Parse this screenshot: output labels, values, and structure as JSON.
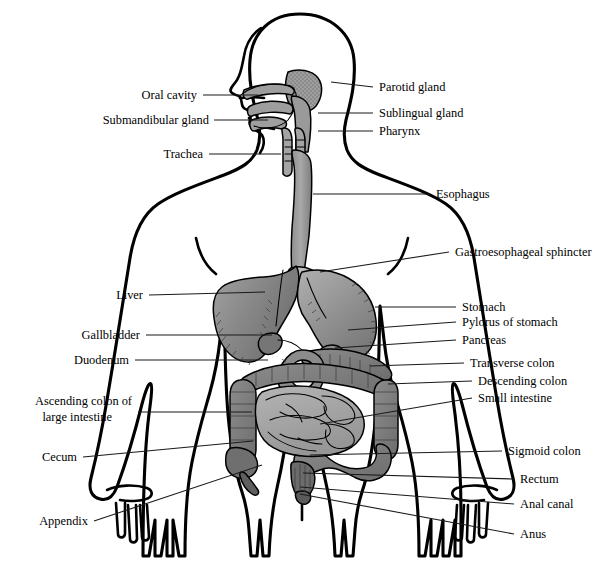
{
  "diagram": {
    "style": "black-and-white line drawing with grayscale shaded organs and straight leader lines",
    "background_color": "#ffffff",
    "line_color": "#000000",
    "colors": {
      "outline": "#000000",
      "leader_line": "#1a1a1a",
      "liver_fill": "#8a8a8a",
      "stomach_fill": "#949494",
      "esophagus_fill": "#9a9a9a",
      "large_intestine_fill": "#7d7d7d",
      "small_intestine_fill": "#a9a9a9",
      "pancreas_fill": "#8f8f8f",
      "gland_fill": "#9e9e9e",
      "body_fill": "#ffffff"
    }
  },
  "labels": {
    "left": [
      {
        "id": "oral-cavity",
        "text": "Oral cavity",
        "text_x": 197,
        "text_y": 99,
        "line_x1": 203,
        "line_y1": 95,
        "line_x2": 258,
        "line_y2": 95
      },
      {
        "id": "submandibular-gland",
        "text": "Submandibular gland",
        "text_x": 209,
        "text_y": 124,
        "line_x1": 214,
        "line_y1": 120,
        "line_x2": 268,
        "line_y2": 120
      },
      {
        "id": "trachea",
        "text": "Trachea",
        "text_x": 203,
        "text_y": 158,
        "line_x1": 209,
        "line_y1": 154,
        "line_x2": 281,
        "line_y2": 154
      },
      {
        "id": "liver",
        "text": "Liver",
        "text_x": 143,
        "text_y": 299,
        "line_x1": 149,
        "line_y1": 295,
        "line_x2": 265,
        "line_y2": 292
      },
      {
        "id": "gallbladder",
        "text": "Gallbladder",
        "text_x": 140,
        "text_y": 339,
        "line_x1": 146,
        "line_y1": 335,
        "line_x2": 272,
        "line_y2": 335
      },
      {
        "id": "duodenum",
        "text": "Duodenum",
        "text_x": 129,
        "text_y": 364,
        "line_x1": 135,
        "line_y1": 360,
        "line_x2": 268,
        "line_y2": 360
      },
      {
        "id": "ascending-colon",
        "text": "Ascending colon of",
        "text2": "large intestine",
        "text_x": 132,
        "text_y": 405,
        "text2_x": 112,
        "text2_y": 421,
        "line_x1": 138,
        "line_y1": 412,
        "line_x2": 252,
        "line_y2": 412
      },
      {
        "id": "cecum",
        "text": "Cecum",
        "text_x": 77,
        "text_y": 461,
        "line_x1": 83,
        "line_y1": 457,
        "line_x2": 253,
        "line_y2": 441
      },
      {
        "id": "appendix",
        "text": "Appendix",
        "text_x": 88,
        "text_y": 525,
        "line_x1": 94,
        "line_y1": 521,
        "line_x2": 262,
        "line_y2": 465
      }
    ],
    "right": [
      {
        "id": "parotid-gland",
        "text": "Parotid gland",
        "text_x": 379,
        "text_y": 91,
        "line_x1": 373,
        "line_y1": 87,
        "line_x2": 331,
        "line_y2": 82
      },
      {
        "id": "sublingual-gland",
        "text": "Sublingual gland",
        "text_x": 379,
        "text_y": 117,
        "line_x1": 373,
        "line_y1": 113,
        "line_x2": 318,
        "line_y2": 113
      },
      {
        "id": "pharynx",
        "text": "Pharynx",
        "text_x": 379,
        "text_y": 135,
        "line_x1": 373,
        "line_y1": 131,
        "line_x2": 318,
        "line_y2": 131
      },
      {
        "id": "esophagus",
        "text": "Esophagus",
        "text_x": 436,
        "text_y": 198,
        "line_x1": 430,
        "line_y1": 194,
        "line_x2": 313,
        "line_y2": 194
      },
      {
        "id": "gastroesophageal-sphincter",
        "text": "Gastroesophageal sphincter",
        "text_x": 455,
        "text_y": 256,
        "line_x1": 449,
        "line_y1": 252,
        "line_x2": 320,
        "line_y2": 272
      },
      {
        "id": "stomach",
        "text": "Stomach",
        "text_x": 462,
        "text_y": 311,
        "line_x1": 456,
        "line_y1": 307,
        "line_x2": 375,
        "line_y2": 307
      },
      {
        "id": "pylorus-of-stomach",
        "text": "Pylorus of stomach",
        "text_x": 462,
        "text_y": 326,
        "line_x1": 456,
        "line_y1": 322,
        "line_x2": 348,
        "line_y2": 330
      },
      {
        "id": "pancreas",
        "text": "Pancreas",
        "text_x": 462,
        "text_y": 344,
        "line_x1": 456,
        "line_y1": 340,
        "line_x2": 335,
        "line_y2": 348
      },
      {
        "id": "transverse-colon",
        "text": "Transverse colon",
        "text_x": 470,
        "text_y": 367,
        "line_x1": 464,
        "line_y1": 363,
        "line_x2": 370,
        "line_y2": 366
      },
      {
        "id": "descending-colon",
        "text": "Descending colon",
        "text_x": 478,
        "text_y": 385,
        "line_x1": 472,
        "line_y1": 381,
        "line_x2": 388,
        "line_y2": 384
      },
      {
        "id": "small-intestine",
        "text": "Small intestine",
        "text_x": 478,
        "text_y": 402,
        "line_x1": 472,
        "line_y1": 398,
        "line_x2": 320,
        "line_y2": 424
      },
      {
        "id": "sigmoid-colon",
        "text": "Sigmoid colon",
        "text_x": 508,
        "text_y": 455,
        "line_x1": 502,
        "line_y1": 451,
        "line_x2": 310,
        "line_y2": 455
      },
      {
        "id": "rectum",
        "text": "Rectum",
        "text_x": 520,
        "text_y": 483,
        "line_x1": 514,
        "line_y1": 479,
        "line_x2": 303,
        "line_y2": 473
      },
      {
        "id": "anal-canal",
        "text": "Anal canal",
        "text_x": 520,
        "text_y": 508,
        "line_x1": 514,
        "line_y1": 504,
        "line_x2": 300,
        "line_y2": 487
      },
      {
        "id": "anus",
        "text": "Anus",
        "text_x": 520,
        "text_y": 538,
        "line_x1": 514,
        "line_y1": 534,
        "line_x2": 300,
        "line_y2": 494
      }
    ]
  },
  "structures": [
    {
      "id": "oral-cavity",
      "name": "Oral cavity"
    },
    {
      "id": "submandibular-gland",
      "name": "Submandibular gland"
    },
    {
      "id": "trachea",
      "name": "Trachea"
    },
    {
      "id": "parotid-gland",
      "name": "Parotid gland"
    },
    {
      "id": "sublingual-gland",
      "name": "Sublingual gland"
    },
    {
      "id": "pharynx",
      "name": "Pharynx"
    },
    {
      "id": "esophagus",
      "name": "Esophagus"
    },
    {
      "id": "gastroesophageal-sphincter",
      "name": "Gastroesophageal sphincter"
    },
    {
      "id": "liver",
      "name": "Liver"
    },
    {
      "id": "stomach",
      "name": "Stomach"
    },
    {
      "id": "pylorus-of-stomach",
      "name": "Pylorus of stomach"
    },
    {
      "id": "gallbladder",
      "name": "Gallbladder"
    },
    {
      "id": "pancreas",
      "name": "Pancreas"
    },
    {
      "id": "duodenum",
      "name": "Duodenum"
    },
    {
      "id": "transverse-colon",
      "name": "Transverse colon"
    },
    {
      "id": "descending-colon",
      "name": "Descending colon"
    },
    {
      "id": "ascending-colon",
      "name": "Ascending colon of large intestine"
    },
    {
      "id": "small-intestine",
      "name": "Small intestine"
    },
    {
      "id": "cecum",
      "name": "Cecum"
    },
    {
      "id": "appendix",
      "name": "Appendix"
    },
    {
      "id": "sigmoid-colon",
      "name": "Sigmoid colon"
    },
    {
      "id": "rectum",
      "name": "Rectum"
    },
    {
      "id": "anal-canal",
      "name": "Anal canal"
    },
    {
      "id": "anus",
      "name": "Anus"
    }
  ]
}
